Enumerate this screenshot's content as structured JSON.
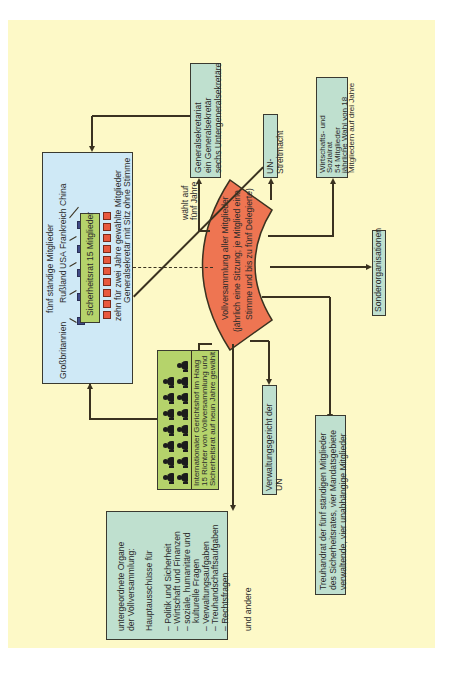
{
  "diagram": {
    "orientation": "rotated-90-ccw",
    "colors": {
      "background": "#fdf9c7",
      "assembly": "#ee7552",
      "security_council_box": "#cfe9f6",
      "security_council_inner": "#b5d36b",
      "court_box": "#b5d36b",
      "organ_box": "#bfe0cf",
      "permanent_member": "#3f4a86",
      "elected_member": "#e8583e"
    },
    "general_assembly": {
      "line1": "Vollversammlung aller Mitglieder",
      "line2": "(jährlich eine Sitzung; je Mitglied eine",
      "line3": "Stimme und bis zu fünf Delegierte)"
    },
    "security_council": {
      "permanent_label": "fünf ständige Mitglieder",
      "permanent_members": [
        "Großbritannien",
        "Rußland",
        "USA",
        "Frankreich",
        "China"
      ],
      "inner_label": "Sicherheitsrat 15 Mitglieder",
      "elected_label": "zehn für zwei Jahre gewählte Mitglieder",
      "elected_count": 10,
      "sg_label": "Generalsekretär mit Sitz ohne Stimme"
    },
    "secretariat": {
      "line1": "Generalsekretariat",
      "line2": "ein Generalsekretär",
      "line3": "sechs Untergeneralsekretäre"
    },
    "elects_label": {
      "line1": "wählt auf",
      "line2": "fünf Jahre"
    },
    "un_force": {
      "label": "UN-Streitmacht"
    },
    "ecosoc": {
      "line1": "Wirtschafts- und Sozialrat",
      "line2": "54 Mitglieder",
      "line3": "jährliche Wahl von 18",
      "line4": "Mitgliedern auf drei Jahre"
    },
    "specialized_agencies": {
      "label": "Sonderorganisationen"
    },
    "court": {
      "line1": "Internationaler Gerichtshof im Haag",
      "line2": "15 Richter von Vollversammlung und",
      "line3": "Sicherheitsrat auf neun Jahre gewählt",
      "judges_count": 15
    },
    "admin_tribunal": {
      "label": "Verwaltungsgericht der UN"
    },
    "trusteeship": {
      "line1": "Treuhandrat der fünf ständigen Mitglieder",
      "line2": "des Sicherheitsrates, vier Mandatsgebiete",
      "line3": "verwaltende, vier unabhängige Mitglieder"
    },
    "subsidiary": {
      "title1": "untergeordnete Organe",
      "title2": "der Vollversammlung:",
      "committees_label": "Hauptausschüsse für",
      "committees": [
        "– Politik und Sicherheit",
        "– Wirtschaft und Finanzen",
        "– soziale, humanitäre und",
        "   kulturelle Fragen",
        "– Verwaltungsaufgaben",
        "– Treuhandschaftsaufgaben",
        "– Rechtsfragen"
      ],
      "footer": "und andere"
    }
  }
}
